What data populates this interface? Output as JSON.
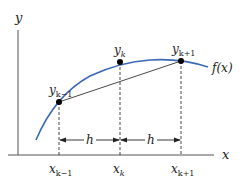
{
  "diagram": {
    "axes": {
      "x_label": "x",
      "y_label": "y"
    },
    "curve": {
      "label": "f(x)",
      "color": "#3a68b5"
    },
    "points": [
      {
        "label_main": "y",
        "label_sub": "k−1",
        "x_label_main": "x",
        "x_label_sub": "k−1"
      },
      {
        "label_main": "y",
        "label_sub": "k",
        "x_label_main": "x",
        "x_label_sub": "k"
      },
      {
        "label_main": "y",
        "label_sub": "k+1",
        "x_label_main": "x",
        "x_label_sub": "k+1"
      }
    ],
    "spacing": [
      {
        "label": "h"
      },
      {
        "label": "h"
      }
    ],
    "colors": {
      "axis": "#444444",
      "chord": "#333333",
      "dashed": "#333333",
      "point": "#000000"
    }
  }
}
